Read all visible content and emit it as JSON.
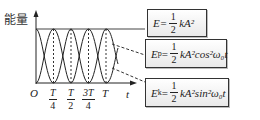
{
  "figure": {
    "y_axis_label": "能量",
    "x_axis_label": "t",
    "origin_label": "O",
    "ticks": [
      {
        "num": "T",
        "den": "4"
      },
      {
        "num": "T",
        "den": "2"
      },
      {
        "num": "3T",
        "den": "4"
      },
      {
        "single": "T"
      }
    ],
    "curves": [
      "total energy E (constant)",
      "potential energy Ep (cos²)",
      "kinetic energy Ek (sin²)"
    ]
  },
  "boxes": {
    "total": {
      "lhs": "E=",
      "num": "1",
      "den": "2",
      "rest": "kA²"
    },
    "potential": {
      "lhs": "E",
      "sub": "p",
      "eq": "=",
      "num": "1",
      "den": "2",
      "rest": "kA²cos²ω₀t"
    },
    "kinetic": {
      "lhs": "E",
      "sub": "k",
      "eq": "=",
      "num": "1",
      "den": "2",
      "rest": "kA²sin²ω₀t"
    }
  },
  "colors": {
    "line": "#222222",
    "box_border": "#333333",
    "box_bg_top": "#ffffff",
    "box_bg_bottom": "#e9e9e9"
  }
}
